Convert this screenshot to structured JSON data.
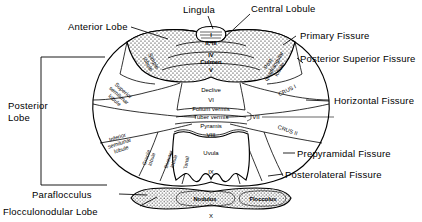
{
  "figure": {
    "type": "anatomical-diagram"
  },
  "labels_left": [
    {
      "name": "anterior-lobe",
      "text": "Anterior Lobe"
    },
    {
      "name": "posterior-lobe-line1",
      "text": "Posterior"
    },
    {
      "name": "posterior-lobe-line2",
      "text": "Lobe"
    },
    {
      "name": "paraflocculus",
      "text": "Paraflocculus"
    },
    {
      "name": "flocculonodular-lobe",
      "text": "Flocculonodular Lobe"
    }
  ],
  "labels_top": [
    {
      "name": "lingula",
      "text": "Lingula"
    },
    {
      "name": "central-lobule",
      "text": "Central Lobule"
    }
  ],
  "labels_right": [
    {
      "name": "primary-fissure",
      "text": "Primary Fissure"
    },
    {
      "name": "posterior-superior-fissure",
      "text": "Posterior Superior Fissure"
    },
    {
      "name": "horizontal-fissure",
      "text": "Horizontal Fissure"
    },
    {
      "name": "prepyramidal-fissure",
      "text": "Prepyramidal Fissure"
    },
    {
      "name": "posterolateral-fissure",
      "text": "Posterolateral Fissure"
    }
  ],
  "lobules_hemisphere": [
    {
      "name": "simple-lobule",
      "l1": "Simple",
      "l2": "lobule",
      "l3": ""
    },
    {
      "name": "superior-semilunar-lobule",
      "l1": "Superior",
      "l2": "semilunar",
      "l3": "lobule"
    },
    {
      "name": "inferior-semilunar-lobule",
      "l1": "Inferior",
      "l2": "semilunar",
      "l3": "lobule"
    },
    {
      "name": "gracile-lobule",
      "l1": "Gracile",
      "l2": "lobule",
      "l3": ""
    },
    {
      "name": "biventer-lobule",
      "l1": "Biventer",
      "l2": "lobule",
      "l3": ""
    },
    {
      "name": "tonsil",
      "l1": "Tonsil",
      "l2": "",
      "l3": ""
    },
    {
      "name": "post-quadrangular-lobule",
      "l1": "Post.",
      "l2": "quadrangular",
      "l3": "lobule"
    },
    {
      "name": "crus-1",
      "l1": "CRUS I",
      "l2": "",
      "l3": ""
    },
    {
      "name": "crus-2",
      "l1": "CRUS II",
      "l2": "",
      "l3": ""
    }
  ],
  "vermis": [
    {
      "name": "vermis-lingula",
      "text": "I",
      "numeral": ""
    },
    {
      "name": "vermis-central-lobule",
      "text": "II, III",
      "numeral": ""
    },
    {
      "name": "vermis-culmen-iv",
      "text": "IV",
      "numeral": ""
    },
    {
      "name": "vermis-culmen",
      "text": "Culmen",
      "numeral": ""
    },
    {
      "name": "vermis-culmen-v",
      "text": "V",
      "numeral": ""
    },
    {
      "name": "vermis-declive",
      "text": "Declive",
      "numeral": "VI"
    },
    {
      "name": "vermis-folium",
      "text": "Folium vermis",
      "numeral": ""
    },
    {
      "name": "vermis-tuber",
      "text": "Tuber vermis",
      "numeral": "VII"
    },
    {
      "name": "vermis-pyramis",
      "text": "Pyramis",
      "numeral": "VIII"
    },
    {
      "name": "vermis-uvula",
      "text": "Uvula",
      "numeral": "IX"
    },
    {
      "name": "vermis-nodulus",
      "text": "Nodulus",
      "numeral": "X"
    }
  ],
  "flocculus": {
    "name": "flocculus",
    "text": "Flocculus"
  },
  "colors": {
    "ink": "#000000",
    "background": "#ffffff"
  }
}
